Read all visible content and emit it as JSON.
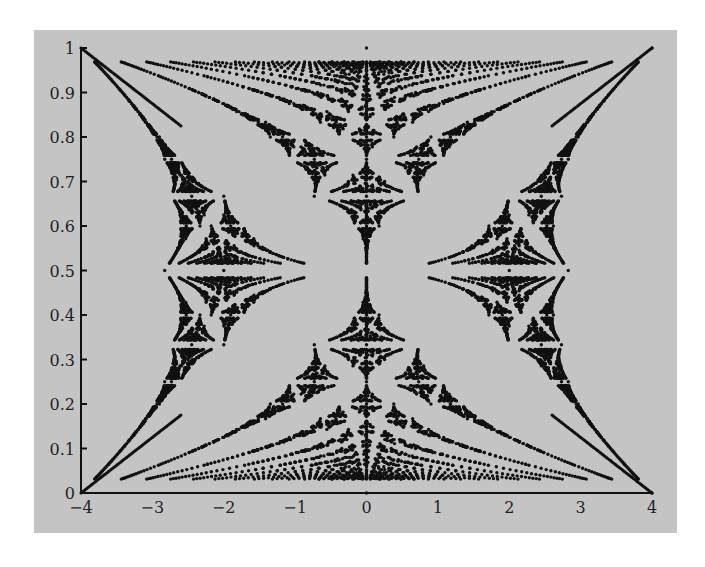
{
  "chart_data": {
    "type": "scatter",
    "title": "",
    "xlabel": "",
    "ylabel": "",
    "xlim": [
      -4,
      4
    ],
    "ylim": [
      0,
      1
    ],
    "xticks": [
      "-4",
      "-3",
      "-2",
      "-1",
      "0",
      "1",
      "2",
      "3",
      "4"
    ],
    "yticks": [
      "0",
      "0.1",
      "0.2",
      "0.3",
      "0.4",
      "0.5",
      "0.6",
      "0.7",
      "0.8",
      "0.9",
      "1"
    ],
    "grid": false,
    "legend": null,
    "generator": {
      "model": "harper",
      "max_q": 32,
      "lambda": 2
    },
    "colors": {
      "background": "#c4c4c4",
      "points": "#111111",
      "axis": "#111111"
    }
  },
  "layout": {
    "plot_left": 47,
    "plot_right": 618,
    "plot_top": 18,
    "plot_bottom": 463
  }
}
